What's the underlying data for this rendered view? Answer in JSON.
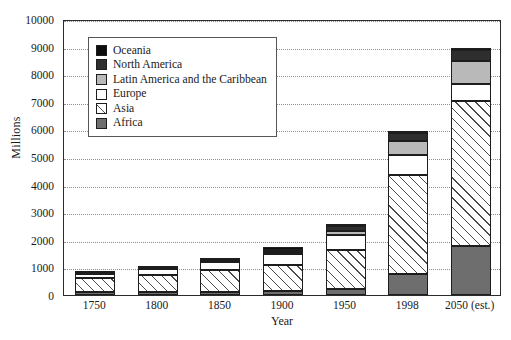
{
  "chart_data": {
    "type": "bar",
    "stacked": true,
    "title": "",
    "xlabel": "Year",
    "ylabel": "Millions",
    "categories": [
      "1750",
      "1800",
      "1850",
      "1900",
      "1950",
      "1998",
      "2050 (est.)"
    ],
    "ylim": [
      0,
      10000
    ],
    "yticks": [
      0,
      1000,
      2000,
      3000,
      4000,
      5000,
      6000,
      7000,
      8000,
      9000,
      10000
    ],
    "grid": true,
    "legend_position": "upper-left-inside",
    "series": [
      {
        "name": "Africa",
        "color": "#6e6e6e",
        "values": [
          105,
          107,
          111,
          133,
          221,
          749,
          1766
        ]
      },
      {
        "name": "Asia",
        "color": "#ffffff",
        "pattern": "diagonal-hatch",
        "values": [
          502,
          635,
          809,
          947,
          1398,
          3585,
          5268
        ]
      },
      {
        "name": "Europe",
        "color": "#ffffff",
        "values": [
          163,
          203,
          276,
          408,
          547,
          729,
          628
        ]
      },
      {
        "name": "Latin America and the Caribbean",
        "color": "#b9b9b9",
        "values": [
          16,
          24,
          38,
          74,
          167,
          504,
          809
        ]
      },
      {
        "name": "North America",
        "color": "#2e2e2e",
        "values": [
          2,
          7,
          26,
          82,
          172,
          305,
          392
        ]
      },
      {
        "name": "Oceania",
        "color": "#0d0d0d",
        "values": [
          2,
          2,
          2,
          6,
          13,
          30,
          46
        ]
      }
    ],
    "totals": [
      790,
      978,
      1262,
      1650,
      2518,
      5902,
      8909
    ]
  },
  "legend": {
    "items": [
      {
        "label": "Oceania"
      },
      {
        "label": "North America"
      },
      {
        "label": "Latin America and the Caribbean"
      },
      {
        "label": "Europe"
      },
      {
        "label": "Asia"
      },
      {
        "label": "Africa"
      }
    ]
  }
}
